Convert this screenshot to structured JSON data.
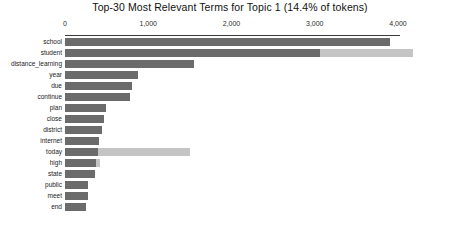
{
  "chart_data": {
    "type": "bar",
    "title": "Top-30 Most Relevant Terms for Topic 1 (14.4% of tokens)",
    "xlabel": "",
    "ylabel": "",
    "xlim": [
      0,
      4200
    ],
    "grid": false,
    "legend_position": "none",
    "orientation": "horizontal",
    "axis_ticks": [
      {
        "label": "0",
        "value": 0
      },
      {
        "label": "1,000",
        "value": 1000
      },
      {
        "label": "2,000",
        "value": 2000
      },
      {
        "label": "3,000",
        "value": 3000
      },
      {
        "label": "4,000",
        "value": 4000
      }
    ],
    "categories": [
      "school",
      "student",
      "distance_learning",
      "year",
      "due",
      "continue",
      "plan",
      "close",
      "district",
      "internet",
      "today",
      "high",
      "state",
      "public",
      "meet",
      "end"
    ],
    "series": [
      {
        "name": "Estimated term frequency within the selected topic",
        "color": "#6b6b6b",
        "values": [
          3900,
          3060,
          1550,
          880,
          800,
          780,
          495,
          470,
          445,
          410,
          395,
          375,
          360,
          280,
          275,
          255
        ]
      },
      {
        "name": "Overall term frequency",
        "color": "#c4c4c4",
        "values": [
          3900,
          4180,
          1550,
          880,
          800,
          780,
          495,
          470,
          445,
          410,
          1500,
          420,
          360,
          280,
          275,
          255
        ]
      }
    ]
  },
  "colors": {
    "topic_bar": "#6b6b6b",
    "overall_bar": "#c4c4c4",
    "axis": "#3a3a3a",
    "text": "#1a1a1a",
    "background": "#ffffff"
  }
}
